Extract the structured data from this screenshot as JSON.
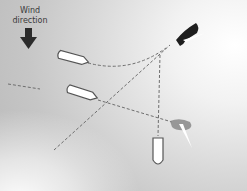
{
  "diagram": {
    "wind_label_line1": "Wind",
    "wind_label_line2": "direction",
    "wind_arrow_icon": "arrow-down-icon",
    "colors": {
      "background_dark": "#bdbdbd",
      "background_light": "#ffffff",
      "hull": "#ffffff",
      "hull_outline": "#555555",
      "dark_sail": "#1e1e1e",
      "light_sail": "#8a8a8a",
      "dash_line": "#6e6e6e",
      "arrow": "#2b2b2b"
    },
    "elements": [
      {
        "type": "boat",
        "label": "boat-upper-left"
      },
      {
        "type": "boat",
        "label": "boat-middle-left"
      },
      {
        "type": "boat",
        "label": "boat-bottom-center"
      },
      {
        "type": "sail",
        "label": "dark-sail-top-right"
      },
      {
        "type": "sail",
        "label": "light-sail-bottom-right"
      }
    ]
  }
}
